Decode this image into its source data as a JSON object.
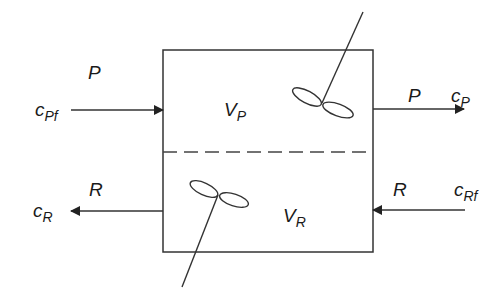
{
  "diagram": {
    "type": "two-compartment stirred reactor (membrane-separated)",
    "compartments": [
      {
        "name": "permeate",
        "volume_label": "V",
        "volume_sub": "P"
      },
      {
        "name": "retentate",
        "volume_label": "V",
        "volume_sub": "R"
      }
    ],
    "streams": {
      "permeate_in": {
        "flow": "P",
        "conc": "c",
        "conc_sub": "Pf"
      },
      "permeate_out": {
        "flow": "P",
        "conc": "c",
        "conc_sub": "P"
      },
      "retentate_in": {
        "flow": "R",
        "conc": "c",
        "conc_sub": "Rf"
      },
      "retentate_out": {
        "flow": "R",
        "conc": "c",
        "conc_sub": "R"
      }
    },
    "colors": {
      "line": "#333333",
      "background": "#ffffff"
    }
  }
}
